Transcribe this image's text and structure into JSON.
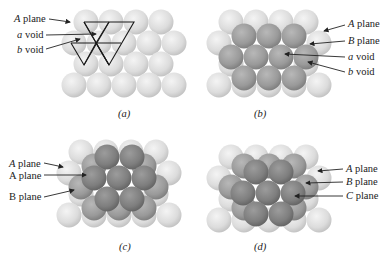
{
  "panels": {
    "a": {
      "caption": "(a)",
      "labels": [
        {
          "italic": "A",
          "rest": " plane"
        },
        {
          "italic": "a",
          "rest": " void"
        },
        {
          "italic": "b",
          "rest": " void"
        }
      ]
    },
    "b": {
      "caption": "(b)",
      "labels": [
        {
          "italic": "A",
          "rest": " plane"
        },
        {
          "italic": "B",
          "rest": " plane"
        },
        {
          "italic": "a",
          "rest": " void"
        },
        {
          "italic": "b",
          "rest": " void"
        }
      ]
    },
    "c": {
      "caption": "(c)",
      "labels": [
        {
          "italic": "A",
          "rest": " plane"
        },
        {
          "italic": "",
          "rest": "A plane"
        },
        {
          "italic": "",
          "rest": "B plane"
        }
      ]
    },
    "d": {
      "caption": "(d)",
      "labels": [
        {
          "italic": "A",
          "rest": " plane"
        },
        {
          "italic": "B",
          "rest": " plane"
        },
        {
          "italic": "C",
          "rest": " plane"
        }
      ]
    }
  },
  "colors": {
    "layer_a": "#d8d8d8",
    "layer_b": "#9a9a9a",
    "layer_c": "#7e7e7e",
    "arrow": "#222222",
    "triangle": "#1a1a1a"
  }
}
